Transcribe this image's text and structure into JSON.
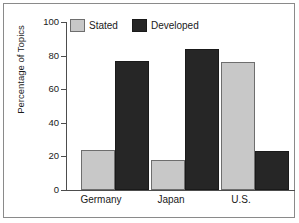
{
  "chart_data": {
    "type": "bar",
    "title": "",
    "subtitle": "",
    "xlabel": "",
    "ylabel": "Percentage of Topics",
    "categories": [
      "Germany",
      "Japan",
      "U.S."
    ],
    "series": [
      {
        "name": "Stated",
        "color": "#c8c8c8",
        "values": [
          24,
          18,
          76
        ]
      },
      {
        "name": "Developed",
        "color": "#262626",
        "values": [
          77,
          84,
          23
        ]
      }
    ],
    "ylim": [
      0,
      100
    ],
    "yticks": [
      0,
      20,
      40,
      60,
      80,
      100
    ],
    "ytick_labels": [
      "0",
      "20",
      "40",
      "60",
      "80",
      "100"
    ],
    "grid": false,
    "legend_position": "top-left-inside",
    "frame": true
  }
}
